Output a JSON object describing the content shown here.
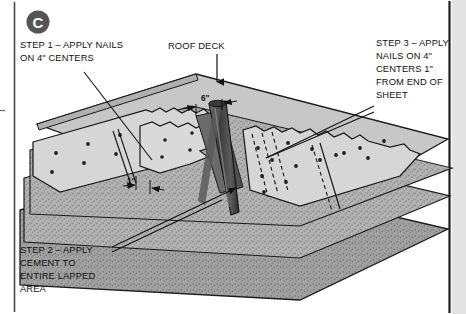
{
  "figure": {
    "badge_label": "C",
    "badge_color": "#555555",
    "callouts": {
      "step1": {
        "name": "step-1-callout",
        "lines": [
          "STEP 1 – APPLY NAILS",
          "ON 4\" CENTERS"
        ]
      },
      "roof_deck": {
        "name": "roof-deck-callout",
        "lines": [
          "ROOF DECK"
        ]
      },
      "step3": {
        "name": "step-3-callout",
        "lines": [
          "STEP 3 – APPLY",
          "NAILS ON 4\"",
          "CENTERS 1\"",
          "FROM END OF",
          "SHEET"
        ]
      },
      "step2": {
        "name": "step-2-callout",
        "lines": [
          "STEP 2 – APPLY",
          "CEMENT TO",
          "ENTIRE LAPPED",
          "AREA"
        ]
      }
    },
    "dimensions": [
      {
        "name": "dimension-6-inch",
        "label": "6\""
      },
      {
        "name": "dimension-1-inch",
        "label": "1\""
      }
    ],
    "colors": {
      "deck_top": "#c9c9c9",
      "deck_edge": "#b4b4b4",
      "underlayment": "#d4d4d4",
      "underlayment_shadow": "#bdbdbd",
      "granule_sheet": "#b0b0b0",
      "granule_sheet_dark": "#9e9e9e",
      "cone_dark": "#4a4a4a",
      "cone_mid": "#6e6e6e",
      "outline": "#1a1a1a",
      "rule": "#3a3a3a",
      "side_band": "#e2e2e2"
    }
  }
}
